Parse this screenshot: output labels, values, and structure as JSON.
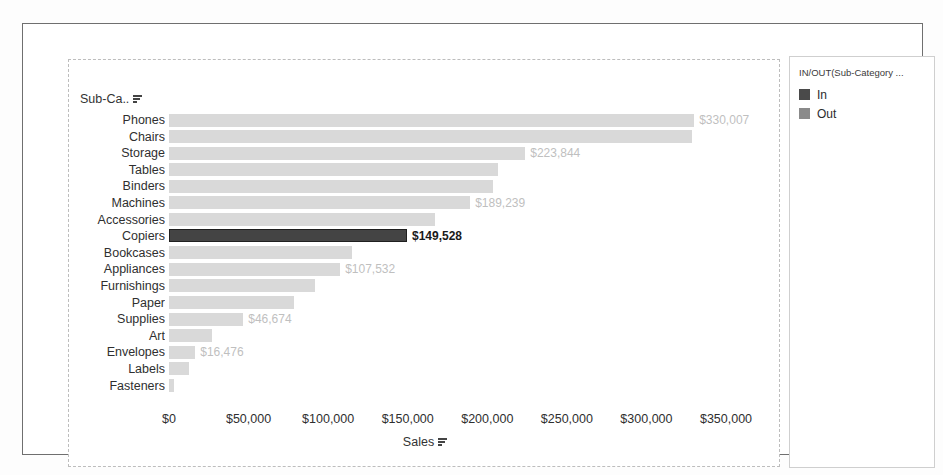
{
  "chart_data": {
    "type": "bar",
    "orientation": "horizontal",
    "title": "",
    "xlabel": "Sales",
    "ylabel": "Sub-Ca..",
    "xlim": [
      0,
      350000
    ],
    "xticks": [
      "$0",
      "$50,000",
      "$100,000",
      "$150,000",
      "$200,000",
      "$250,000",
      "$300,000",
      "$350,000"
    ],
    "xtick_values": [
      0,
      50000,
      100000,
      150000,
      200000,
      250000,
      300000,
      350000
    ],
    "grid": false,
    "legend_position": "right",
    "categories": [
      "Phones",
      "Chairs",
      "Storage",
      "Tables",
      "Binders",
      "Machines",
      "Accessories",
      "Copiers",
      "Bookcases",
      "Appliances",
      "Furnishings",
      "Paper",
      "Supplies",
      "Art",
      "Envelopes",
      "Labels",
      "Fasteners"
    ],
    "values": [
      330007,
      328449,
      223844,
      206966,
      203413,
      189239,
      167380,
      149528,
      114880,
      107532,
      91705,
      78479,
      46674,
      27119,
      16476,
      12486,
      3024
    ],
    "labels": [
      "$330,007",
      "",
      "$223,844",
      "",
      "",
      "$189,239",
      "",
      "$149,528",
      "",
      "$107,532",
      "",
      "",
      "$46,674",
      "",
      "$16,476",
      "",
      ""
    ],
    "highlighted": [
      "Copiers"
    ],
    "series": [
      {
        "name": "In",
        "color": "#444444"
      },
      {
        "name": "Out",
        "color": "#d9d9d9"
      }
    ]
  },
  "axis": {
    "field_header_label": "Sub-Ca..",
    "x_title_label": "Sales",
    "sort_icon": "sort-descending-icon"
  },
  "legend": {
    "title": "IN/OUT(Sub-Category ...",
    "items": [
      {
        "label": "In",
        "color": "#4a4a4a"
      },
      {
        "label": "Out",
        "color": "#8a8a8a"
      }
    ]
  },
  "colors": {
    "bar_default": "#d9d9d9",
    "bar_selected": "#444444",
    "label_muted": "#bfbfbf",
    "label_strong": "#1a1a1a",
    "frame": "#6f6f6f",
    "dashed_frame": "#bdbdbd"
  }
}
